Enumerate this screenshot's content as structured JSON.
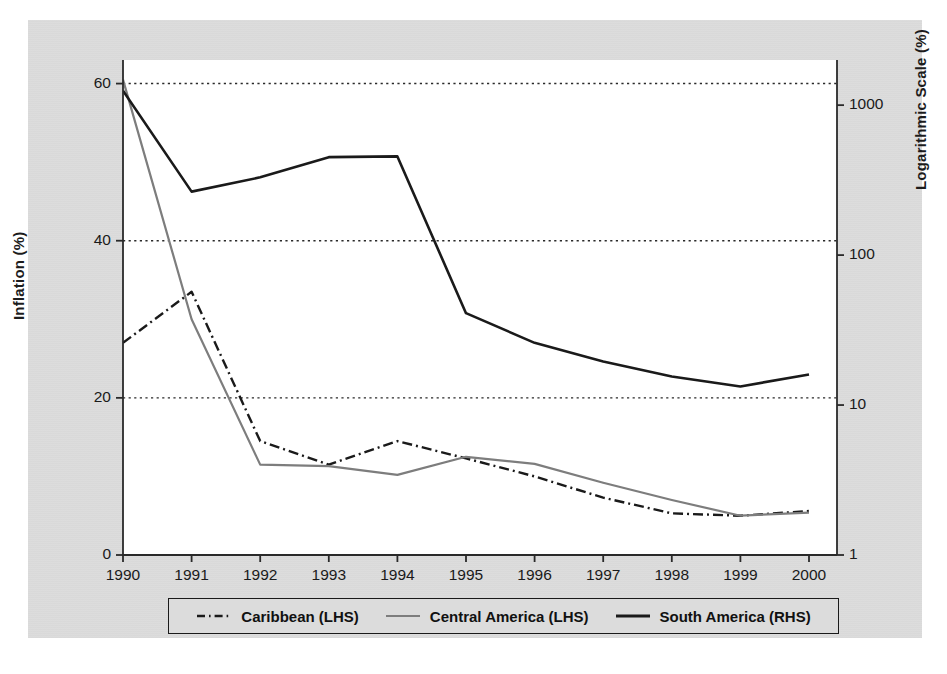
{
  "chart_data": {
    "type": "line",
    "title": "",
    "xlabel": "",
    "categories": [
      "1990",
      "1991",
      "1992",
      "1993",
      "1994",
      "1995",
      "1996",
      "1997",
      "1998",
      "1999",
      "2000"
    ],
    "x": [
      1990,
      1991,
      1992,
      1993,
      1994,
      1995,
      1996,
      1997,
      1998,
      1999,
      2000
    ],
    "grid": true,
    "legend_position": "bottom",
    "axes": {
      "left": {
        "label": "Inflation (%)",
        "ticks": [
          0,
          20,
          40,
          60
        ],
        "tick_labels": [
          "0",
          "20",
          "40",
          "60"
        ],
        "lim": [
          0,
          63
        ],
        "scale": "linear"
      },
      "right": {
        "label": "Logarithmic Scale (%)",
        "ticks": [
          1,
          10,
          100,
          1000
        ],
        "tick_labels": [
          "1",
          "10",
          "100",
          "1000"
        ],
        "lim": [
          1,
          2000
        ],
        "scale": "log"
      }
    },
    "series": [
      {
        "name": "Caribbean (LHS)",
        "axis": "left",
        "color": "#1a1a1a",
        "style": "dash-dot",
        "values": [
          27.0,
          33.5,
          14.5,
          11.5,
          14.5,
          12.3,
          10.0,
          7.3,
          5.3,
          5.0,
          5.6
        ]
      },
      {
        "name": "Central America (LHS)",
        "axis": "left",
        "color": "#7d7d7d",
        "style": "solid",
        "values": [
          60.5,
          30.0,
          11.5,
          11.3,
          10.2,
          12.5,
          11.6,
          9.2,
          7.0,
          5.0,
          5.4
        ]
      },
      {
        "name": "South America (RHS)",
        "axis": "right",
        "color": "#1a1a1a",
        "style": "solid",
        "values": [
          1250,
          265,
          330,
          450,
          455,
          41,
          26,
          19.5,
          15.5,
          13.3,
          16.0
        ]
      }
    ],
    "legend": [
      {
        "label": "Caribbean (LHS)",
        "style": "dash-dot",
        "color": "#1a1a1a"
      },
      {
        "label": "Central America (LHS)",
        "style": "solid",
        "color": "#7d7d7d"
      },
      {
        "label": "South America (RHS)",
        "style": "solid",
        "color": "#1a1a1a"
      }
    ],
    "colors": {
      "panel_background": "#dcdcdc",
      "plot_background": "#ffffff",
      "axis": "#2a2a2a",
      "grid": "#2a2a2a"
    }
  }
}
